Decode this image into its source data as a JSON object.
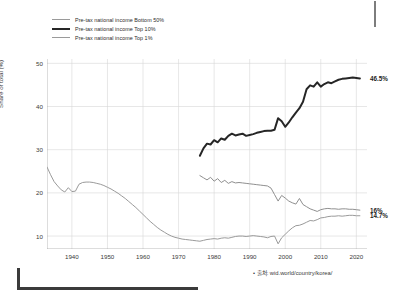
{
  "legend": {
    "items": [
      {
        "label": "Pre-tax national income Bottom 50%",
        "style": "thin",
        "color": "#9a9a9a"
      },
      {
        "label": "Pre-tax national income Top 10%",
        "style": "thick",
        "color": "#262626"
      },
      {
        "label": "Pre-tax national income Top 1%",
        "style": "thin",
        "color": "#8f8f8f"
      }
    ]
  },
  "source": {
    "text": "• 출처: wid.world/country/korea/"
  },
  "end_labels": {
    "top10": "46.5%",
    "top1": "16%",
    "bottom50": "14.7%"
  },
  "axis": {
    "y_title": "Share of total (%)",
    "y_ticks": [
      "50",
      "40",
      "30",
      "20",
      "10"
    ],
    "x_ticks": [
      "1940",
      "1950",
      "1960",
      "1970",
      "1980",
      "1990",
      "2000",
      "2010",
      "2020"
    ]
  },
  "chart_data": {
    "type": "line",
    "title": "",
    "subtitle": "",
    "xlabel": "",
    "ylabel": "Share of total (%)",
    "xlim": [
      1933,
      2023
    ],
    "ylim": [
      7,
      51
    ],
    "grid": true,
    "legend_position": "top-left",
    "annotations": [
      {
        "text": "46.5%",
        "series": "Pre-tax national income Top 10%",
        "x": 2021,
        "y": 46.5
      },
      {
        "text": "16%",
        "series": "Pre-tax national income Top 1%",
        "x": 2021,
        "y": 16.0
      },
      {
        "text": "14.7%",
        "series": "Pre-tax national income Bottom 50%",
        "x": 2021,
        "y": 14.7
      }
    ],
    "series": [
      {
        "name": "Pre-tax national income Bottom 50%",
        "color": "#9a9a9a",
        "width": 1,
        "points": [
          [
            1933,
            26.0
          ],
          [
            1934,
            24.2
          ],
          [
            1935,
            22.6
          ],
          [
            1936,
            21.6
          ],
          [
            1937,
            20.7
          ],
          [
            1938,
            20.2
          ],
          [
            1939,
            21.2
          ],
          [
            1940,
            20.3
          ],
          [
            1941,
            20.4
          ],
          [
            1942,
            22.0
          ],
          [
            1943,
            22.4
          ],
          [
            1944,
            22.5
          ],
          [
            1945,
            22.5
          ],
          [
            1946,
            22.4
          ],
          [
            1947,
            22.2
          ],
          [
            1948,
            22.0
          ],
          [
            1949,
            21.7
          ],
          [
            1950,
            21.3
          ],
          [
            1951,
            20.9
          ],
          [
            1952,
            20.4
          ],
          [
            1953,
            19.9
          ],
          [
            1954,
            19.3
          ],
          [
            1955,
            18.7
          ],
          [
            1956,
            18.0
          ],
          [
            1957,
            17.3
          ],
          [
            1958,
            16.6
          ],
          [
            1959,
            15.8
          ],
          [
            1960,
            15.0
          ],
          [
            1961,
            14.2
          ],
          [
            1962,
            13.4
          ],
          [
            1963,
            12.7
          ],
          [
            1964,
            12.0
          ],
          [
            1965,
            11.4
          ],
          [
            1966,
            10.9
          ],
          [
            1967,
            10.4
          ],
          [
            1968,
            10.0
          ],
          [
            1969,
            9.7
          ],
          [
            1970,
            9.5
          ],
          [
            1971,
            9.3
          ],
          [
            1972,
            9.2
          ],
          [
            1973,
            9.1
          ],
          [
            1974,
            9.0
          ],
          [
            1975,
            8.9
          ],
          [
            1976,
            8.8
          ],
          [
            1977,
            9.0
          ],
          [
            1978,
            9.2
          ],
          [
            1979,
            9.3
          ],
          [
            1980,
            9.4
          ],
          [
            1981,
            9.3
          ],
          [
            1982,
            9.5
          ],
          [
            1983,
            9.6
          ],
          [
            1984,
            9.5
          ],
          [
            1985,
            9.7
          ],
          [
            1986,
            9.9
          ],
          [
            1987,
            10.0
          ],
          [
            1988,
            10.0
          ],
          [
            1989,
            9.9
          ],
          [
            1990,
            10.0
          ],
          [
            1991,
            10.1
          ],
          [
            1992,
            10.0
          ],
          [
            1993,
            9.9
          ],
          [
            1994,
            9.8
          ],
          [
            1995,
            9.6
          ],
          [
            1996,
            9.9
          ],
          [
            1997,
            10.0
          ],
          [
            1998,
            8.2
          ],
          [
            1999,
            9.6
          ],
          [
            2000,
            10.4
          ],
          [
            2001,
            11.2
          ],
          [
            2002,
            11.9
          ],
          [
            2003,
            12.4
          ],
          [
            2004,
            12.5
          ],
          [
            2005,
            12.8
          ],
          [
            2006,
            13.2
          ],
          [
            2007,
            13.6
          ],
          [
            2008,
            13.5
          ],
          [
            2009,
            13.8
          ],
          [
            2010,
            14.2
          ],
          [
            2011,
            14.3
          ],
          [
            2012,
            14.5
          ],
          [
            2013,
            14.6
          ],
          [
            2014,
            14.6
          ],
          [
            2015,
            14.7
          ],
          [
            2016,
            14.6
          ],
          [
            2017,
            14.7
          ],
          [
            2018,
            14.8
          ],
          [
            2019,
            14.8
          ],
          [
            2020,
            14.7
          ],
          [
            2021,
            14.7
          ]
        ]
      },
      {
        "name": "Pre-tax national income Top 10%",
        "color": "#262626",
        "width": 2,
        "points": [
          [
            1976,
            28.6
          ],
          [
            1977,
            30.3
          ],
          [
            1978,
            31.4
          ],
          [
            1979,
            31.2
          ],
          [
            1980,
            32.2
          ],
          [
            1981,
            31.7
          ],
          [
            1982,
            32.6
          ],
          [
            1983,
            32.3
          ],
          [
            1984,
            33.2
          ],
          [
            1985,
            33.7
          ],
          [
            1986,
            33.3
          ],
          [
            1987,
            33.5
          ],
          [
            1988,
            33.7
          ],
          [
            1989,
            33.2
          ],
          [
            1990,
            33.4
          ],
          [
            1991,
            33.6
          ],
          [
            1992,
            33.9
          ],
          [
            1993,
            34.1
          ],
          [
            1994,
            34.3
          ],
          [
            1995,
            34.4
          ],
          [
            1996,
            34.4
          ],
          [
            1997,
            34.6
          ],
          [
            1998,
            37.3
          ],
          [
            1999,
            36.6
          ],
          [
            2000,
            35.3
          ],
          [
            2001,
            36.3
          ],
          [
            2002,
            37.5
          ],
          [
            2003,
            38.6
          ],
          [
            2004,
            39.6
          ],
          [
            2005,
            41.1
          ],
          [
            2006,
            44.0
          ],
          [
            2007,
            44.9
          ],
          [
            2008,
            44.6
          ],
          [
            2009,
            45.6
          ],
          [
            2010,
            44.6
          ],
          [
            2011,
            45.2
          ],
          [
            2012,
            45.6
          ],
          [
            2013,
            45.4
          ],
          [
            2014,
            45.8
          ],
          [
            2015,
            46.2
          ],
          [
            2016,
            46.4
          ],
          [
            2017,
            46.5
          ],
          [
            2018,
            46.6
          ],
          [
            2019,
            46.7
          ],
          [
            2020,
            46.6
          ],
          [
            2021,
            46.5
          ]
        ]
      },
      {
        "name": "Pre-tax national income Top 1%",
        "color": "#8f8f8f",
        "width": 1,
        "points": [
          [
            1976,
            24.0
          ],
          [
            1977,
            23.5
          ],
          [
            1978,
            23.0
          ],
          [
            1979,
            23.6
          ],
          [
            1980,
            22.7
          ],
          [
            1981,
            23.3
          ],
          [
            1982,
            22.4
          ],
          [
            1983,
            22.9
          ],
          [
            1984,
            22.2
          ],
          [
            1985,
            22.6
          ],
          [
            1986,
            22.3
          ],
          [
            1987,
            22.4
          ],
          [
            1988,
            22.3
          ],
          [
            1989,
            22.2
          ],
          [
            1990,
            22.1
          ],
          [
            1991,
            22.0
          ],
          [
            1992,
            21.9
          ],
          [
            1993,
            21.8
          ],
          [
            1994,
            21.7
          ],
          [
            1995,
            21.6
          ],
          [
            1996,
            21.1
          ],
          [
            1997,
            19.6
          ],
          [
            1998,
            18.1
          ],
          [
            1999,
            19.4
          ],
          [
            2000,
            18.8
          ],
          [
            2001,
            18.1
          ],
          [
            2002,
            17.7
          ],
          [
            2003,
            17.4
          ],
          [
            2004,
            18.7
          ],
          [
            2005,
            17.3
          ],
          [
            2006,
            16.8
          ],
          [
            2007,
            16.3
          ],
          [
            2008,
            16.0
          ],
          [
            2009,
            15.7
          ],
          [
            2010,
            16.1
          ],
          [
            2011,
            16.3
          ],
          [
            2012,
            16.4
          ],
          [
            2013,
            16.3
          ],
          [
            2014,
            16.3
          ],
          [
            2015,
            16.2
          ],
          [
            2016,
            16.3
          ],
          [
            2017,
            16.3
          ],
          [
            2018,
            16.2
          ],
          [
            2019,
            16.2
          ],
          [
            2020,
            16.1
          ],
          [
            2021,
            16.0
          ]
        ]
      }
    ]
  }
}
